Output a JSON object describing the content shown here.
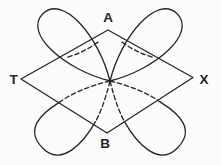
{
  "diagram": {
    "vertex_labels": {
      "top": "A",
      "left": "T",
      "right": "X",
      "bottom": "B"
    },
    "colors": {
      "line": "#262626",
      "background": "#fcfcfc"
    }
  }
}
